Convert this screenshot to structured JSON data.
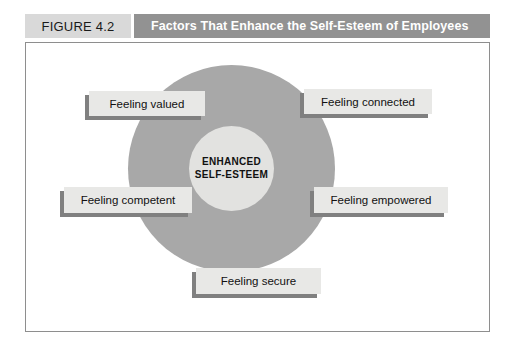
{
  "header": {
    "figure_number": "FIGURE 4.2",
    "title": "Factors That Enhance the Self-Esteem of Employees",
    "number_bg": "#d9d9d9",
    "title_bg": "#929292",
    "title_color": "#ffffff"
  },
  "diagram": {
    "type": "concentric-circle-hub-and-spoke",
    "center_label_line1": "ENHANCED",
    "center_label_line2": "SELF-ESTEEM",
    "outer_circle_color": "#a8a8a8",
    "inner_circle_color": "#e2e2e0",
    "box_fill_color": "#e8e8e6",
    "box_shadow_color": "#808080",
    "factors": [
      {
        "label": "Feeling valued",
        "position": "top-left"
      },
      {
        "label": "Feeling connected",
        "position": "top-right"
      },
      {
        "label": "Feeling competent",
        "position": "middle-left"
      },
      {
        "label": "Feeling empowered",
        "position": "middle-right"
      },
      {
        "label": "Feeling secure",
        "position": "bottom-center"
      }
    ]
  },
  "frame": {
    "border_color": "#8e8e8e",
    "background": "#ffffff"
  }
}
